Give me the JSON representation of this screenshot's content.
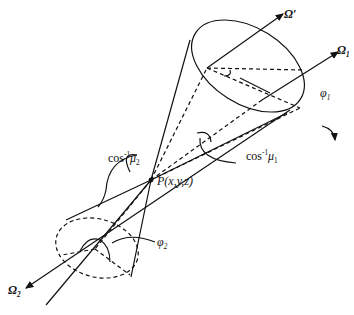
{
  "diagram": {
    "type": "double-cone scattering geometry",
    "labels": {
      "omega_prime": "Ω′",
      "omega_1": "Ω",
      "omega_1_sub": "1",
      "omega_2": "Ω",
      "omega_2_sub": "2",
      "phi_1": "φ",
      "phi_1_sub": "1",
      "phi_2": "φ",
      "phi_2_sub": "2",
      "cos_mu1_prefix": "cos",
      "cos_mu1_sup": "-1",
      "cos_mu1_var": "μ",
      "cos_mu1_sub": "1",
      "cos_mu2_prefix": "cos",
      "cos_mu2_sup": "-1",
      "cos_mu2_var": "μ",
      "cos_mu2_sub": "2",
      "point": "P(x,y,z)"
    },
    "colors": {
      "stroke": "#111111",
      "background": "#ffffff"
    }
  }
}
